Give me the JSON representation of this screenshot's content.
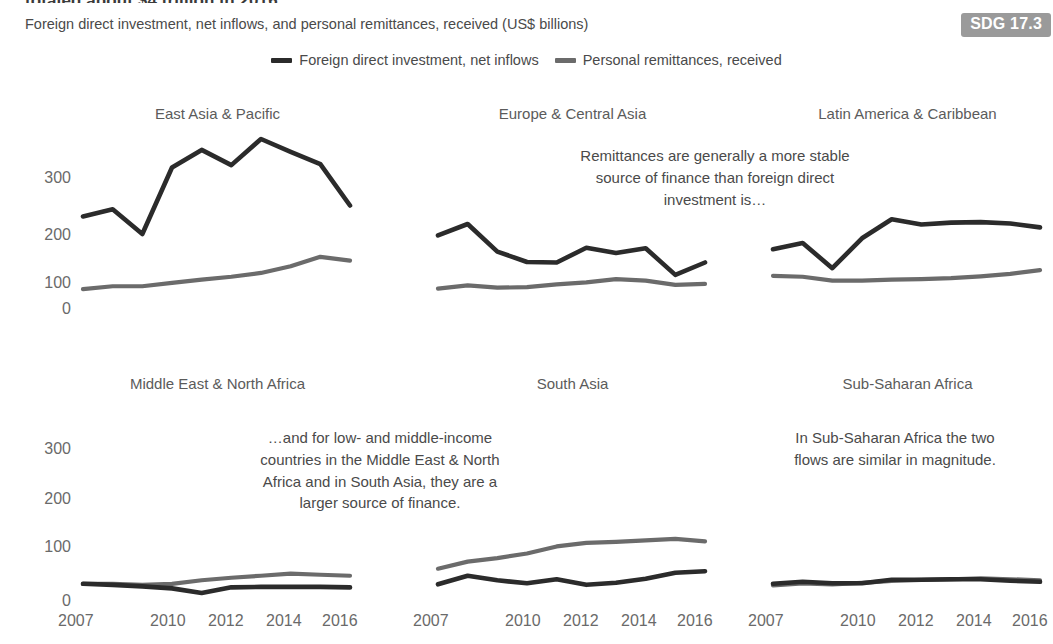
{
  "header": {
    "kicker": "totaled about $4 trillion in 2016",
    "subtitle": "Foreign direct investment, net inflows, and personal remittances, received (US$ billions)",
    "sdg_badge": "SDG 17.3"
  },
  "legend": {
    "items": [
      {
        "label": "Foreign direct investment, net inflows",
        "color": "#2b2b2b"
      },
      {
        "label": "Personal remittances, received",
        "color": "#6b6b6b"
      }
    ]
  },
  "annotations": [
    {
      "name": "annotation-remittances-stable",
      "text": "Remittances are generally a more stable source of finance than foreign direct investment is…"
    },
    {
      "name": "annotation-low-middle-income",
      "text": "…and for low- and middle-income countries in the Middle East & North Africa and in South Asia, they are a larger source of finance."
    },
    {
      "name": "annotation-sub-saharan",
      "text": "In Sub-Saharan Africa the two flows are similar in magnitude."
    }
  ],
  "axis": {
    "ylabels_top": [
      "300",
      "200",
      "100",
      "0"
    ],
    "ylabels_bottom": [
      "300",
      "200",
      "100",
      "0"
    ],
    "xlabels": [
      "2007",
      "2010",
      "2012",
      "2014",
      "2016"
    ]
  },
  "chart_data": {
    "type": "line",
    "title": "totaled about $4 trillion in 2016",
    "subtitle": "Foreign direct investment, net inflows, and personal remittances, received (US$ billions)",
    "xlabel": "",
    "ylabel": "US$ billions",
    "x": [
      2007,
      2008,
      2009,
      2010,
      2011,
      2012,
      2013,
      2014,
      2015,
      2016
    ],
    "xtick_labels": [
      "2007",
      "2010",
      "2012",
      "2014",
      "2016"
    ],
    "xtick_values": [
      2007,
      2010,
      2012,
      2014,
      2016
    ],
    "ylim": [
      0,
      400
    ],
    "ytick_values": [
      0,
      100,
      200,
      300
    ],
    "grid": false,
    "legend_position": "top-center",
    "panels": [
      {
        "name": "East Asia & Pacific",
        "series": [
          {
            "name": "Foreign direct investment, net inflows",
            "color": "#2b2b2b",
            "values": [
              197,
              212,
              160,
              300,
              337,
              305,
              360,
              333,
              307,
              220
            ]
          },
          {
            "name": "Personal remittances, received",
            "color": "#6b6b6b",
            "values": [
              44,
              50,
              50,
              57,
              64,
              70,
              78,
              92,
              112,
              104
            ]
          }
        ]
      },
      {
        "name": "Europe & Central Asia",
        "series": [
          {
            "name": "Foreign direct investment, net inflows",
            "color": "#2b2b2b",
            "values": [
              157,
              181,
              123,
              101,
              100,
              131,
              120,
              130,
              74,
              100
            ]
          },
          {
            "name": "Personal remittances, received",
            "color": "#6b6b6b",
            "values": [
              45,
              52,
              47,
              48,
              54,
              58,
              65,
              62,
              53,
              55
            ]
          }
        ]
      },
      {
        "name": "Latin America & Caribbean",
        "series": [
          {
            "name": "Foreign direct investment, net inflows",
            "color": "#2b2b2b",
            "values": [
              128,
              141,
              88,
              151,
              191,
              180,
              184,
              185,
              182,
              174
            ]
          },
          {
            "name": "Personal remittances, received",
            "color": "#6b6b6b",
            "values": [
              72,
              70,
              62,
              62,
              64,
              65,
              67,
              71,
              76,
              84
            ]
          }
        ]
      },
      {
        "name": "Middle East & North Africa",
        "series": [
          {
            "name": "Foreign direct investment, net inflows",
            "color": "#2b2b2b",
            "values": [
              36,
              34,
              31,
              27,
              18,
              29,
              30,
              30,
              30,
              29
            ]
          },
          {
            "name": "Personal remittances, received",
            "color": "#6b6b6b",
            "values": [
              36,
              36,
              34,
              36,
              43,
              48,
              52,
              56,
              54,
              52
            ]
          }
        ]
      },
      {
        "name": "South Asia",
        "series": [
          {
            "name": "Foreign direct investment, net inflows",
            "color": "#2b2b2b",
            "values": [
              35,
              52,
              43,
              37,
              45,
              34,
              38,
              46,
              58,
              61
            ]
          },
          {
            "name": "Personal remittances, received",
            "color": "#6b6b6b",
            "values": [
              66,
              80,
              87,
              96,
              110,
              117,
              119,
              122,
              125,
              120
            ]
          }
        ]
      },
      {
        "name": "Sub-Saharan Africa",
        "series": [
          {
            "name": "Foreign direct investment, net inflows",
            "color": "#2b2b2b",
            "values": [
              36,
              40,
              37,
              37,
              44,
              44,
              45,
              45,
              42,
              40
            ]
          },
          {
            "name": "Personal remittances, received",
            "color": "#6b6b6b",
            "values": [
              33,
              37,
              35,
              38,
              42,
              44,
              45,
              47,
              45,
              43
            ]
          }
        ]
      }
    ]
  }
}
